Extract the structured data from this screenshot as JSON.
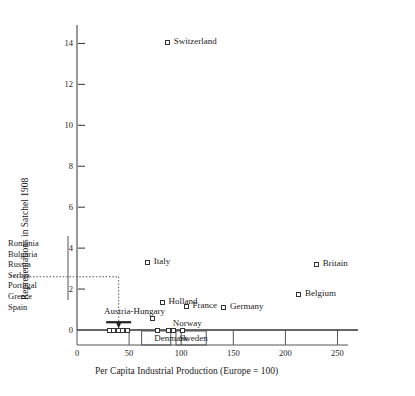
{
  "chart_data": {
    "type": "scatter",
    "title": "",
    "xlabel": "Per Capita Industrial Production (Europe = 100)",
    "ylabel": "Representations in Satchel 1908",
    "xlim": [
      0,
      262
    ],
    "ylim": [
      -0.55,
      14.9
    ],
    "xticks": [
      0,
      50,
      100,
      150,
      200,
      250
    ],
    "yticks": [
      0,
      2,
      4,
      6,
      8,
      10,
      12,
      14
    ],
    "grid": false,
    "legend": "none",
    "points": [
      {
        "name": "Switzerland",
        "x": 87,
        "y": 14.05,
        "label_side": "right"
      },
      {
        "name": "Italy",
        "x": 68,
        "y": 3.3,
        "label_side": "right"
      },
      {
        "name": "Britain",
        "x": 230,
        "y": 3.2,
        "label_side": "right"
      },
      {
        "name": "Belgium",
        "x": 213,
        "y": 1.75,
        "label_side": "right"
      },
      {
        "name": "Holland",
        "x": 82,
        "y": 1.35,
        "label_side": "right"
      },
      {
        "name": "France",
        "x": 105,
        "y": 1.15,
        "label_side": "right"
      },
      {
        "name": "Germany",
        "x": 141,
        "y": 1.1,
        "label_side": "right"
      },
      {
        "name": "Austria-Hungary",
        "x": 72,
        "y": 0.55,
        "label_side": "above"
      },
      {
        "name": "Norway",
        "x": 88,
        "y": 0.0,
        "label_side": "above-right"
      },
      {
        "name": "Denmark",
        "x": 77,
        "y": 0.0,
        "label_side": "below"
      },
      {
        "name": "Sweden",
        "x": 101,
        "y": 0.0,
        "label_side": "below"
      }
    ],
    "zero_cluster": [
      {
        "x": 31,
        "y": 0.0
      },
      {
        "x": 35,
        "y": 0.0
      },
      {
        "x": 40,
        "y": 0.0
      },
      {
        "x": 44,
        "y": 0.0
      },
      {
        "x": 48,
        "y": 0.0
      },
      {
        "x": 93,
        "y": 0.0
      }
    ],
    "annotation": {
      "country_list": [
        "Romania",
        "Bulgaria",
        "Russia",
        "Serbia",
        "Portugal",
        "Greece",
        "Spain"
      ],
      "dotted_level_y": 2.6,
      "dotted_drop_x": 40,
      "arrow_target_y": 0.42,
      "bar_x_start": 28,
      "bar_x_end": 52,
      "bar_y": 0.38
    },
    "tick_label_strings": {
      "x": [
        "0",
        "50",
        "100",
        "150",
        "200",
        "250"
      ],
      "y": [
        "0",
        "2",
        "4",
        "6",
        "8",
        "10",
        "12",
        "14"
      ]
    }
  },
  "colors": {
    "ink": "#222222",
    "marker_edge": "#333333",
    "marker_fill": "#ffffff",
    "axis": "#333333",
    "dotted": "#555555"
  }
}
